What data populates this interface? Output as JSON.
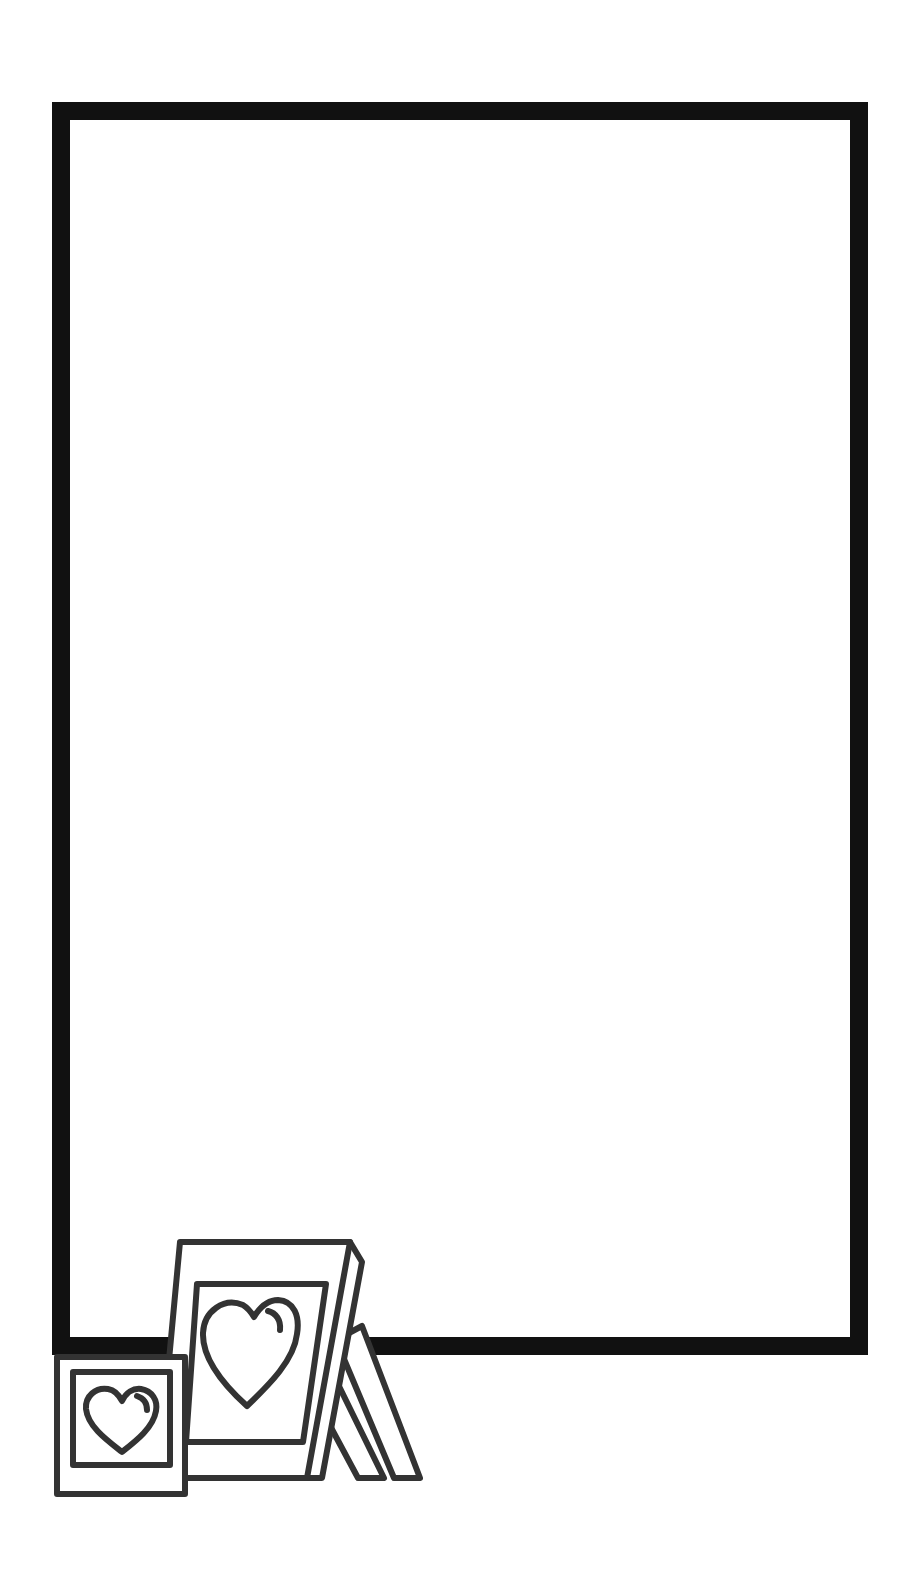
{
  "page": {
    "title": "Blank photo frame page with heart picture frames",
    "background": "#ffffff"
  },
  "border_frame": {
    "label": "Empty rectangular border",
    "color": "#111111",
    "stroke_width": 18
  },
  "decorations": {
    "small_frame": {
      "label": "Small square picture frame with heart",
      "icon": "heart-icon"
    },
    "large_frame": {
      "label": "Tilted standing picture frame with heart",
      "icon": "heart-icon"
    },
    "line_color": "#333333"
  }
}
